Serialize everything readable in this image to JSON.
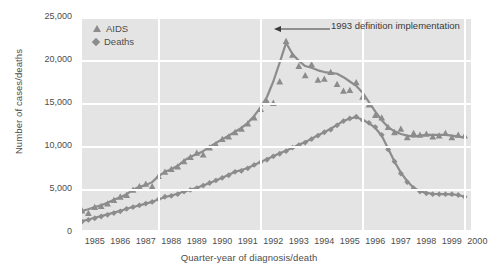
{
  "chart_data": {
    "type": "line",
    "title": "",
    "subtitle": "",
    "xlabel": "Quarter-year of diagnosis/death",
    "ylabel": "Number of cases/deaths",
    "xlim": [
      1985.0,
      2000.25
    ],
    "ylim": [
      0,
      25000
    ],
    "grid": true,
    "grid_color": "#ffffff",
    "plot_background": "#e4e4e4",
    "series_color": "#8c8c8c",
    "legend_position": "top-left",
    "y_ticks": [
      "0",
      "5,000",
      "10,000",
      "15,000",
      "20,000",
      "25,000"
    ],
    "y_tick_values": [
      0,
      5000,
      10000,
      15000,
      20000,
      25000
    ],
    "x_ticks": [
      "1985",
      "1986",
      "1987",
      "1988",
      "1989",
      "1990",
      "1991",
      "1992",
      "1993",
      "1994",
      "1995",
      "1996",
      "1997",
      "1998",
      "1999",
      "2000"
    ],
    "x_tick_values": [
      1985,
      1986,
      1987,
      1988,
      1989,
      1990,
      1991,
      1992,
      1993,
      1994,
      1995,
      1996,
      1997,
      1998,
      1999,
      2000
    ],
    "vertical_gridlines_at": [
      1988,
      1992,
      1996,
      2000
    ],
    "annotations": [
      {
        "text": "1993 definition implementation",
        "points_to_x": 1993.0,
        "points_to_y": 24200,
        "arrow": "left"
      }
    ],
    "legend": [
      {
        "name": "AIDS",
        "marker": "triangle",
        "color": "#8c8c8c"
      },
      {
        "name": "Deaths",
        "marker": "diamond",
        "color": "#8c8c8c"
      }
    ],
    "x": [
      1985.0,
      1985.25,
      1985.5,
      1985.75,
      1986.0,
      1986.25,
      1986.5,
      1986.75,
      1987.0,
      1987.25,
      1987.5,
      1987.75,
      1988.0,
      1988.25,
      1988.5,
      1988.75,
      1989.0,
      1989.25,
      1989.5,
      1989.75,
      1990.0,
      1990.25,
      1990.5,
      1990.75,
      1991.0,
      1991.25,
      1991.5,
      1991.75,
      1992.0,
      1992.25,
      1992.5,
      1992.75,
      1993.0,
      1993.25,
      1993.5,
      1993.75,
      1994.0,
      1994.25,
      1994.5,
      1994.75,
      1995.0,
      1995.25,
      1995.5,
      1995.75,
      1996.0,
      1996.25,
      1996.5,
      1996.75,
      1997.0,
      1997.25,
      1997.5,
      1997.75,
      1998.0,
      1998.25,
      1998.5,
      1998.75,
      1999.0,
      1999.25,
      1999.5,
      1999.75,
      2000.0
    ],
    "series": [
      {
        "name": "AIDS",
        "marker": "triangle",
        "color": "#8c8c8c",
        "values": [
          2500,
          2200,
          2900,
          3000,
          3300,
          3700,
          4100,
          4300,
          4900,
          5300,
          5600,
          5300,
          6500,
          7000,
          7300,
          7600,
          8200,
          8700,
          9200,
          9000,
          9800,
          10200,
          10800,
          11100,
          11600,
          12000,
          12600,
          13300,
          14300,
          15200,
          15000,
          17500,
          22200,
          20600,
          19300,
          18200,
          19500,
          17700,
          17800,
          18600,
          17200,
          16400,
          16500,
          17400,
          15700,
          14800,
          13600,
          13300,
          12200,
          11600,
          12000,
          11000,
          11500,
          11300,
          11400,
          11100,
          11200,
          11500,
          11000,
          11300,
          11200
        ],
        "smoothed_values": [
          2450,
          2650,
          2900,
          3100,
          3400,
          3750,
          4050,
          4400,
          4900,
          5250,
          5450,
          5800,
          6500,
          7000,
          7300,
          7700,
          8300,
          8750,
          9050,
          9400,
          9900,
          10350,
          10800,
          11200,
          11650,
          12100,
          12700,
          13500,
          14500,
          15700,
          17500,
          19700,
          22000,
          20700,
          19900,
          19300,
          19100,
          18800,
          18600,
          18500,
          18400,
          18000,
          17500,
          17000,
          16200,
          15100,
          14000,
          13000,
          12200,
          11700,
          11400,
          11200,
          11100,
          11200,
          11300,
          11300,
          11300,
          11300,
          11200,
          11100,
          11000
        ]
      },
      {
        "name": "Deaths",
        "marker": "diamond",
        "color": "#8c8c8c",
        "values": [
          1200,
          1400,
          1600,
          1800,
          2000,
          2200,
          2400,
          2700,
          2900,
          3100,
          3300,
          3500,
          3800,
          4100,
          4200,
          4400,
          4700,
          4900,
          5100,
          5400,
          5700,
          6000,
          6300,
          6600,
          7000,
          7100,
          7400,
          7800,
          8100,
          8400,
          8800,
          9100,
          9400,
          9800,
          10100,
          10400,
          10800,
          11200,
          11600,
          11900,
          12400,
          12900,
          13200,
          13400,
          13000,
          12700,
          12200,
          11300,
          9600,
          8200,
          6800,
          5800,
          5100,
          4700,
          4500,
          4400,
          4400,
          4400,
          4400,
          4300,
          4100
        ],
        "smoothed_values": [
          1250,
          1450,
          1650,
          1850,
          2050,
          2250,
          2450,
          2700,
          2900,
          3100,
          3300,
          3500,
          3800,
          4050,
          4250,
          4450,
          4700,
          4900,
          5150,
          5400,
          5700,
          6000,
          6300,
          6650,
          7000,
          7200,
          7450,
          7800,
          8150,
          8450,
          8800,
          9150,
          9450,
          9800,
          10150,
          10450,
          10850,
          11250,
          11600,
          12000,
          12450,
          12900,
          13200,
          13350,
          13050,
          12650,
          12100,
          11200,
          9700,
          8200,
          6900,
          5900,
          5150,
          4750,
          4550,
          4450,
          4400,
          4400,
          4380,
          4300,
          4100
        ]
      }
    ]
  }
}
